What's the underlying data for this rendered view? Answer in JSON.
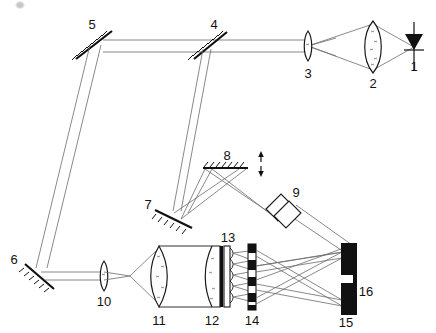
{
  "figure": {
    "background_color": "#ffffff",
    "line_color": "#1a1a1a",
    "ray_color": "#6b6b6b",
    "solid_fill_color": "#111111"
  },
  "labels": [
    {
      "id": "1",
      "text": "1",
      "x": 414,
      "y": 71,
      "component": "laser-diode"
    },
    {
      "id": "2",
      "text": "2",
      "x": 373,
      "y": 77,
      "component": "collimating-lens"
    },
    {
      "id": "3",
      "text": "3",
      "x": 308,
      "y": 76,
      "component": "focusing-lens"
    },
    {
      "id": "4",
      "text": "4",
      "x": 214,
      "y": 27,
      "component": "fold-mirror-4"
    },
    {
      "id": "5",
      "text": "5",
      "x": 91,
      "y": 26,
      "component": "fold-mirror-5"
    },
    {
      "id": "6",
      "text": "6",
      "x": 14,
      "y": 261,
      "component": "fold-mirror-6"
    },
    {
      "id": "7",
      "text": "7",
      "x": 151,
      "y": 205,
      "component": "fold-mirror-7"
    },
    {
      "id": "8",
      "text": "8",
      "x": 229,
      "y": 155,
      "component": "scanning-mirror-8"
    },
    {
      "id": "9",
      "text": "9",
      "x": 272,
      "y": 191,
      "component": "compensator-plates-9"
    },
    {
      "id": "10",
      "text": "10",
      "x": 104,
      "y": 303,
      "component": "lens-10"
    },
    {
      "id": "11",
      "text": "11",
      "x": 161,
      "y": 325,
      "component": "lens-11"
    },
    {
      "id": "12",
      "text": "12",
      "x": 212,
      "y": 325,
      "component": "lens-12"
    },
    {
      "id": "13",
      "text": "13",
      "x": 229,
      "y": 242,
      "component": "microlens-array-13"
    },
    {
      "id": "14",
      "text": "14",
      "x": 253,
      "y": 325,
      "component": "mask-14"
    },
    {
      "id": "15",
      "text": "15",
      "x": 345,
      "y": 325,
      "component": "detector-15"
    },
    {
      "id": "16",
      "text": "16",
      "x": 364,
      "y": 295,
      "component": "substrate-16"
    }
  ],
  "components": [
    {
      "ref": "1",
      "name": "laser-diode",
      "kind": "source",
      "note": "filled triangle with vertical bar (diode symbol)"
    },
    {
      "ref": "2",
      "name": "collimating-lens",
      "kind": "lens",
      "note": "large biconvex lens"
    },
    {
      "ref": "3",
      "name": "focusing-lens",
      "kind": "lens",
      "note": "small biconvex lens"
    },
    {
      "ref": "4",
      "name": "fold-mirror-4",
      "kind": "mirror",
      "note": "tilted plane mirror with back hatching"
    },
    {
      "ref": "5",
      "name": "fold-mirror-5",
      "kind": "mirror",
      "note": "tilted plane mirror with back hatching"
    },
    {
      "ref": "6",
      "name": "fold-mirror-6",
      "kind": "mirror",
      "note": "tilted plane mirror with back hatching"
    },
    {
      "ref": "7",
      "name": "fold-mirror-7",
      "kind": "mirror",
      "note": "tilted plane mirror with back hatching"
    },
    {
      "ref": "8",
      "name": "scanning-mirror-8",
      "kind": "mirror",
      "note": "horizontal mirror, translatable (double arrow)"
    },
    {
      "ref": "9",
      "name": "compensator-plates-9",
      "kind": "plates",
      "note": "two overlapping tilted parallel plates"
    },
    {
      "ref": "10",
      "name": "lens-10",
      "kind": "lens",
      "note": "small biconvex lens"
    },
    {
      "ref": "11",
      "name": "lens-11",
      "kind": "lens",
      "note": "large biconvex lens"
    },
    {
      "ref": "12",
      "name": "lens-12",
      "kind": "lens",
      "note": "large plano-convex lens"
    },
    {
      "ref": "13",
      "name": "microlens-array-13",
      "kind": "array",
      "note": "microlens / lenslet array on a plate"
    },
    {
      "ref": "14",
      "name": "mask-14",
      "kind": "mask",
      "note": "vertical bar with alternating opaque and clear segments"
    },
    {
      "ref": "15",
      "name": "detector-15",
      "kind": "detector",
      "note": "split pair of opaque detector bars"
    },
    {
      "ref": "16",
      "name": "substrate-16",
      "kind": "substrate",
      "note": "thin vertical backing plate behind detectors"
    }
  ],
  "annotations": [
    {
      "name": "translation-arrow",
      "text": "",
      "x": 253,
      "y": 168,
      "note": "vertical double-headed arrow indicating mirror 8 translation"
    }
  ]
}
